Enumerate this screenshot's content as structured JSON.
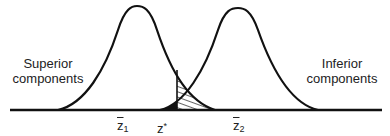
{
  "diagram": {
    "type": "overlapping-distributions",
    "left_label_line1": "Superior",
    "left_label_line2": "components",
    "right_label_line1": "Inferior",
    "right_label_line2": "components",
    "axis_labels": {
      "z1_base": "z",
      "z1_sub": "1",
      "zstar_base": "z",
      "zstar_sup": "*",
      "z2_base": "z",
      "z2_sub": "2"
    },
    "regions": [
      {
        "name": "type-I-error",
        "fill": "solid-black",
        "side": "left of z*"
      },
      {
        "name": "type-II-error",
        "fill": "hatched",
        "side": "right of z*"
      }
    ],
    "colors": {
      "stroke": "#111111",
      "background": "#ffffff"
    }
  }
}
